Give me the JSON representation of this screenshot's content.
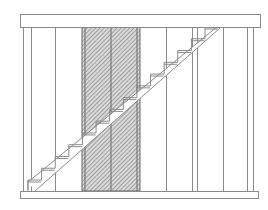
{
  "drawing": {
    "title": "Staircase framing elevation",
    "colors": {
      "line": "#8a8a8a",
      "dark_line": "#6a6a6a",
      "hatch": "#7a7a7a",
      "background": "#ffffff"
    },
    "components": {
      "top_beam": "header beam",
      "bottom_plate": "sole plate",
      "hatched_panel": "hatched infill panel",
      "stair": {
        "label": "stair stringer",
        "step_count": 13
      },
      "studs": {
        "count": 10
      }
    }
  }
}
